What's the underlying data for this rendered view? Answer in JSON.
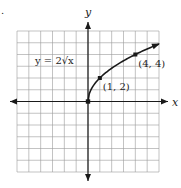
{
  "problem_marker": ".",
  "chart_data": {
    "type": "line",
    "title": "",
    "xlabel": "x",
    "ylabel": "y",
    "xlim": [
      -6,
      6
    ],
    "ylim": [
      -6,
      6
    ],
    "grid": true,
    "grid_step": 1,
    "series": [
      {
        "name": "y = 2√x",
        "function": "y = 2*sqrt(x)",
        "domain": [
          0,
          6
        ],
        "x": [
          0,
          0.25,
          0.5,
          1,
          1.5,
          2,
          2.5,
          3,
          3.5,
          4,
          4.5,
          5,
          5.5,
          6
        ],
        "y": [
          0,
          1,
          1.414,
          2,
          2.449,
          2.828,
          3.162,
          3.464,
          3.742,
          4,
          4.243,
          4.472,
          4.69,
          4.899
        ],
        "end_arrow": true
      }
    ],
    "points": [
      {
        "x": 0,
        "y": 0,
        "label": ""
      },
      {
        "x": 1,
        "y": 2,
        "label": "(1, 2)"
      },
      {
        "x": 4,
        "y": 4,
        "label": "(4, 4)"
      }
    ],
    "annotations": [
      {
        "text": "y = 2√x",
        "at": [
          -3.5,
          3
        ],
        "kind": "equation"
      }
    ]
  }
}
